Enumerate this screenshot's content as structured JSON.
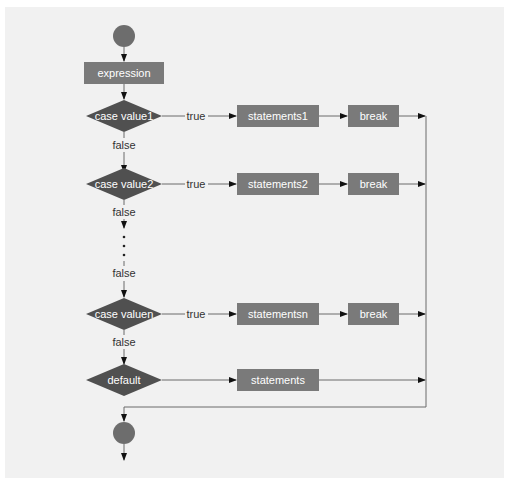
{
  "colors": {
    "panel": "#f1f1f1",
    "box": "#7a7a7a",
    "decision": "#505050",
    "terminal": "#6d6d6d",
    "line": "#6a6a6a",
    "arrow": "#111111",
    "label": "#333333"
  },
  "diagram": {
    "type": "flowchart",
    "start": {
      "shape": "circle"
    },
    "expression": {
      "label": "expression"
    },
    "cases": [
      {
        "condition": "case value1",
        "true_label": "true",
        "statement": "statements1",
        "break": "break",
        "false_label": "false"
      },
      {
        "condition": "case value2",
        "true_label": "true",
        "statement": "statements2",
        "break": "break",
        "false_label": "false"
      },
      {
        "condition": "case valuen",
        "true_label": "true",
        "statement": "statementsn",
        "break": "break",
        "false_label": "false"
      }
    ],
    "ellipsis_false_label": "false",
    "default": {
      "condition": "default",
      "statement": "statements"
    },
    "end": {
      "shape": "circle"
    }
  }
}
